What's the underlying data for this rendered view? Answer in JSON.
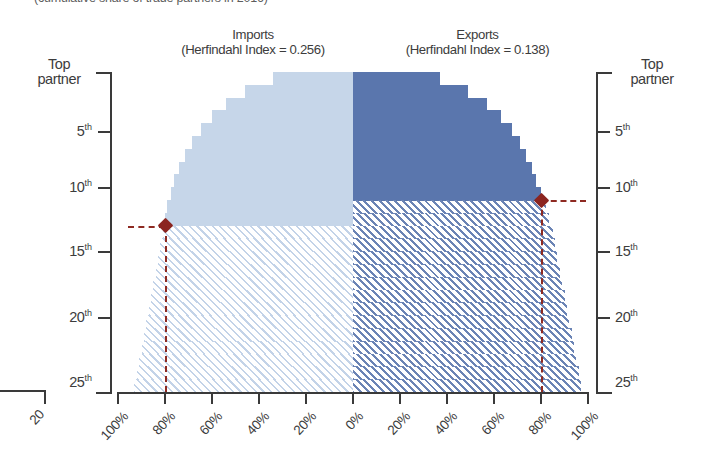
{
  "top_fragment": "(cumulative share of trade partners in 2016)",
  "panels": {
    "imports": {
      "title": "Imports",
      "subtitle": "(Herfindahl Index = 0.256)",
      "herfindahl_index": 0.256
    },
    "exports": {
      "title": "Exports",
      "subtitle": "(Herfindahl Index = 0.138)",
      "herfindahl_index": 0.138
    }
  },
  "axes": {
    "y_top_label": "Top partner",
    "y_top_label_line1": "Top",
    "y_top_label_line2": "partner",
    "y_ticks": [
      "5",
      "10",
      "15",
      "20",
      "25"
    ],
    "y_tick_suffix": "th",
    "x_ticks": [
      "100%",
      "80%",
      "60%",
      "40%",
      "20%",
      "0%",
      "20%",
      "40%",
      "60%",
      "80%",
      "100%"
    ]
  },
  "orphan_fragment": {
    "label": "20"
  },
  "colors": {
    "solid_light_blue": "#c6d6e9",
    "solid_dark_blue": "#5a76ad",
    "hatch_light_blue": "#c3d3e8",
    "hatch_dark_blue": "#6b84b5",
    "marker_red": "#8b2520",
    "axis_gray": "#3a3a3a"
  },
  "markers": {
    "imports": {
      "rank": 12,
      "share": "80%",
      "label": "12th partner at 80%"
    },
    "exports": {
      "rank": 10,
      "share": "80%",
      "label": "10th partner at 80%"
    }
  },
  "chart_data": {
    "type": "area",
    "title": "Cumulative share of trade partners",
    "xlabel": "",
    "ylabel": "Partner rank",
    "grid": false,
    "legend": "none",
    "ylim": [
      1,
      26
    ],
    "xlim": [
      0,
      100
    ],
    "y_tick_values": [
      1,
      5,
      10,
      15,
      20,
      25
    ],
    "x_tick_values": [
      100,
      80,
      60,
      40,
      20,
      0,
      20,
      40,
      60,
      80,
      100
    ],
    "note": "Mirrored Lorenz-style cumulative curves. Imports plotted leftward from center, exports rightward from center. Solid fill above the 80% threshold marker, hatched fill below it.",
    "series": [
      {
        "name": "Imports",
        "direction": "left",
        "fill": "solid_light_blue",
        "hatch_fill": "hatch_light_blue",
        "herfindahl_index": 0.256,
        "threshold_rank": 12,
        "threshold_share": 80,
        "ranks": [
          1,
          2,
          3,
          4,
          5,
          6,
          7,
          8,
          9,
          10,
          11,
          12,
          13,
          14,
          15,
          16,
          17,
          18,
          19,
          20,
          21,
          22,
          23,
          24,
          25
        ],
        "cumulative_share": [
          34,
          46,
          54,
          60,
          64.5,
          68.5,
          71.5,
          74,
          76,
          77.5,
          79,
          80,
          81,
          82,
          83,
          84,
          85,
          86,
          87,
          88,
          89,
          90,
          91,
          92,
          93
        ]
      },
      {
        "name": "Exports",
        "direction": "right",
        "fill": "solid_dark_blue",
        "hatch_fill": "hatch_dark_blue",
        "herfindahl_index": 0.138,
        "threshold_rank": 10,
        "threshold_share": 80,
        "ranks": [
          1,
          2,
          3,
          4,
          5,
          6,
          7,
          8,
          9,
          10,
          11,
          12,
          13,
          14,
          15,
          16,
          17,
          18,
          19,
          20,
          21,
          22,
          23,
          24,
          25
        ],
        "cumulative_share": [
          37,
          49,
          57,
          63,
          67.5,
          71,
          73.5,
          76,
          78,
          80,
          82,
          83.5,
          85,
          86,
          87,
          88,
          89,
          90,
          91,
          92,
          93,
          94,
          95,
          96,
          97
        ]
      }
    ]
  }
}
